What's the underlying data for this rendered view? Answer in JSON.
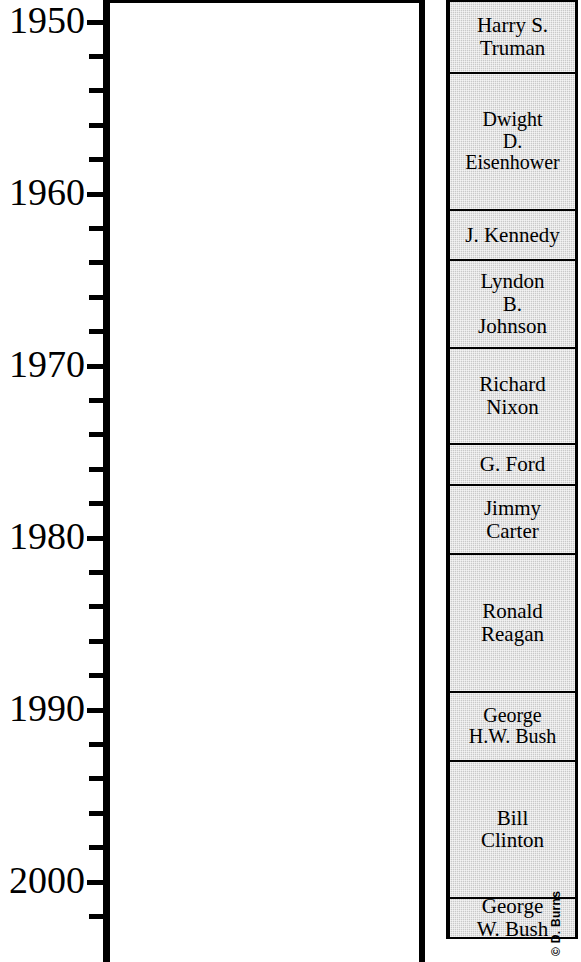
{
  "chart_data": {
    "type": "table",
    "title": "",
    "subtitle": "",
    "xlabel": "",
    "ylabel": "",
    "orientation": "vertical-timeline",
    "grid": false,
    "legend": null,
    "axis": {
      "name": "year-axis",
      "ylim": [
        1948.7,
        2003.3
      ],
      "major_tick_step": 10,
      "minor_tick_step": 2,
      "tick_labels": [
        "1950",
        "1960",
        "1970",
        "1980",
        "1990",
        "2000"
      ],
      "tick_values": [
        1950,
        1960,
        1970,
        1980,
        1990,
        2000
      ],
      "minor_tick_values": [
        1950,
        1952,
        1954,
        1956,
        1958,
        1960,
        1962,
        1964,
        1966,
        1968,
        1970,
        1972,
        1974,
        1976,
        1978,
        1980,
        1982,
        1984,
        1986,
        1988,
        1990,
        1992,
        1994,
        1996,
        1998,
        2000,
        2002
      ],
      "direction": "increasing-downward"
    },
    "categories": [
      "Harry S. Truman",
      "Dwight D. Eisenhower",
      "J. Kennedy",
      "Lyndon B. Johnson",
      "Richard Nixon",
      "G. Ford",
      "Jimmy Carter",
      "Ronald Reagan",
      "George H.W. Bush",
      "Bill Clinton",
      "George W. Bush"
    ],
    "series": [
      {
        "name": "U.S. Presidents",
        "values": [
          4.3,
          8.0,
          2.9,
          5.1,
          5.6,
          2.4,
          4.0,
          8.0,
          4.0,
          8.0,
          2.3
        ]
      }
    ],
    "plot_area": {
      "name": "empty-plot-area",
      "content": "",
      "fill": "#ffffff"
    }
  },
  "presidents": {
    "column_label": "U.S. Presidents",
    "fill_color": "#c9c9c9",
    "border_color": "#000000",
    "items": [
      {
        "id": "truman",
        "label": "Harry S.\nTruman",
        "start": 1948.7,
        "end": 1953.0
      },
      {
        "id": "eisenhower",
        "label": "Dwight\nD.\nEisenhower",
        "start": 1953.0,
        "end": 1961.0
      },
      {
        "id": "kennedy",
        "label": "J. Kennedy",
        "start": 1961.0,
        "end": 1963.9
      },
      {
        "id": "johnson",
        "label": "Lyndon\nB.\nJohnson",
        "start": 1963.9,
        "end": 1969.0
      },
      {
        "id": "nixon",
        "label": "Richard\nNixon",
        "start": 1969.0,
        "end": 1974.6
      },
      {
        "id": "ford",
        "label": "G. Ford",
        "start": 1974.6,
        "end": 1977.0
      },
      {
        "id": "carter",
        "label": "Jimmy\nCarter",
        "start": 1977.0,
        "end": 1981.0
      },
      {
        "id": "reagan",
        "label": "Ronald\nReagan",
        "start": 1981.0,
        "end": 1989.0
      },
      {
        "id": "ghw-bush",
        "label": "George\nH.W. Bush",
        "start": 1989.0,
        "end": 1993.0
      },
      {
        "id": "clinton",
        "label": "Bill\nClinton",
        "start": 1993.0,
        "end": 2001.0
      },
      {
        "id": "gw-bush",
        "label": "George\nW. Bush",
        "start": 2001.0,
        "end": 2003.3
      }
    ]
  },
  "credit": {
    "text": "© D. Burns"
  },
  "geometry": {
    "year_top": 1948.72,
    "px_per_year": 17.2,
    "y_at_year_top": 0
  }
}
